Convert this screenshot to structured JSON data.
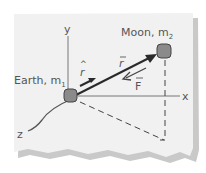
{
  "diagram": {
    "type": "physics-vector-diagram",
    "labels": {
      "earth": "Earth, m",
      "earth_sub": "1",
      "moon": "Moon, m",
      "moon_sub": "2",
      "axis_x": "x",
      "axis_y": "y",
      "axis_z": "z",
      "r_vector": "r",
      "r_hat": "r",
      "force": "F"
    },
    "colors": {
      "paper": "#f1f1f1",
      "paper_shadow": "#c8c8c8",
      "ink": "#444444",
      "axis": "#777777",
      "body_fill": "#8a8a8a",
      "vector": "#2a2a2a"
    }
  }
}
